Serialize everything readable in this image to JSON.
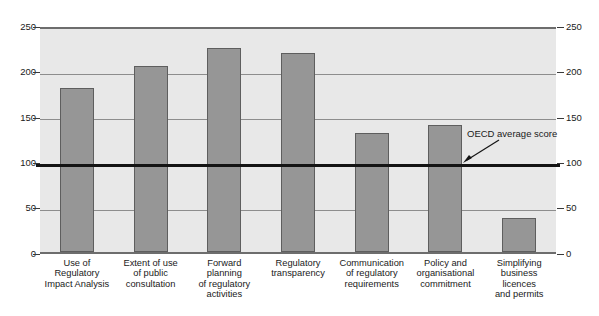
{
  "chart_data": {
    "type": "bar",
    "title": "",
    "xlabel": "",
    "ylabel": "",
    "ylim": [
      0,
      250
    ],
    "yticks": [
      0,
      50,
      100,
      150,
      200,
      250
    ],
    "grid": true,
    "legend": "none",
    "categories": [
      "Use of\nRegulatory\nImpact Analysis",
      "Extent of use\nof public\nconsultation",
      "Forward\nplanning\nof regulatory\nactivities",
      "Regulatory\ntransparency",
      "Communication\nof regulatory\nrequirements",
      "Policy and\norganisational\ncommitment",
      "Simplifying\nbusiness\nlicences\nand permits"
    ],
    "values": [
      181,
      205,
      225,
      219,
      131,
      140,
      37
    ],
    "annotations": [
      {
        "text": "OECD average score",
        "value": 100,
        "kind": "reference-line"
      }
    ]
  },
  "axis": {
    "left_ticks": [
      "250",
      "200",
      "150",
      "100",
      "50",
      "0"
    ],
    "right_ticks": [
      "250",
      "200",
      "150",
      "100",
      "50",
      "0"
    ]
  },
  "colors": {
    "bar_fill": "#969696",
    "bar_stroke": "#5e5e5e",
    "plot_background": "#e8e8e8",
    "gridline": "#8d8d8d",
    "average_line": "#141414",
    "frame": "#6d6d6d",
    "text": "#1a1a1a"
  },
  "annotation": {
    "label": "OECD average score"
  }
}
